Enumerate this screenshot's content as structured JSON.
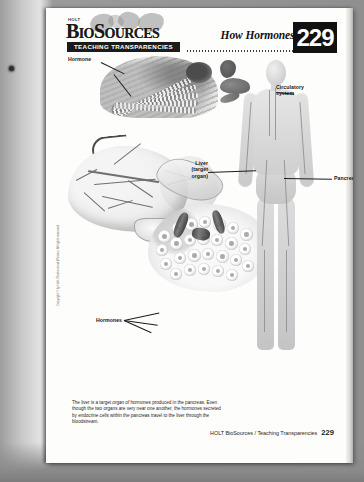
{
  "document": {
    "publisher_mark": "HOLT",
    "brand": "BioSources",
    "series_bar": "TEACHING TRANSPARENCIES",
    "title": "How Hormones Work",
    "page_number": "229"
  },
  "figure": {
    "labels": [
      {
        "id": "hormone",
        "text": "Hormone"
      },
      {
        "id": "circulatory",
        "text": "Circulatory\nsystem"
      },
      {
        "id": "liver-target",
        "text": "Liver\n(target\norgan)"
      },
      {
        "id": "pancreas",
        "text": "Pancreas"
      },
      {
        "id": "hormones-bottom",
        "text": "Hormones"
      }
    ]
  },
  "caption": {
    "text": "The liver is a target organ of hormones produced in the pancreas. Even though the two organs are very near one another, the hormones secreted by endocrine cells within the pancreas travel to the liver through the bloodstream."
  },
  "side_copyright": {
    "text": "Copyright © by Holt, Rinehart and Winston. All rights reserved."
  },
  "footer": {
    "text": "HOLT BioSources / Teaching Transparencies",
    "page_number": "229"
  },
  "colors": {
    "paper": "#fdfdfc",
    "ink": "#111111",
    "badge_bg": "#111111",
    "badge_fg": "#ffffff",
    "scan_background": "#8f8f8f"
  }
}
